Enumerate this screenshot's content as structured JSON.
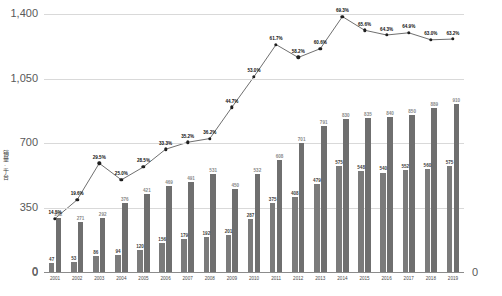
{
  "axes": {
    "y_left_title": "销量·千台",
    "y_left_ticks": [
      "1,400",
      "1,050",
      "700",
      "350",
      "0"
    ],
    "y_right_ticks": [
      "70%",
      "52.5%",
      "35%",
      "17.5%",
      "0"
    ]
  },
  "chart_data": {
    "type": "bar",
    "title": "",
    "subtitle": "",
    "xlabel": "",
    "ylabel": "销量·千台",
    "y2label": "",
    "ylim": [
      0,
      1400
    ],
    "y2lim": [
      0,
      70
    ],
    "yticks": [
      0,
      350,
      700,
      1050,
      1400
    ],
    "y2ticks": [
      0,
      17.5,
      35,
      52.5,
      70
    ],
    "grid": true,
    "legend": "none",
    "categories": [
      "2001",
      "2002",
      "2003",
      "2004",
      "2005",
      "2006",
      "2007",
      "2008",
      "2009",
      "2010",
      "2011",
      "2012",
      "2013",
      "2014",
      "2015",
      "2016",
      "2017",
      "2018",
      "2019"
    ],
    "series": [
      {
        "name": "series-front",
        "chart_type": "bar",
        "axis": "left",
        "values": [
          47,
          53,
          86,
          94,
          120,
          156,
          179,
          192,
          201,
          287,
          375,
          408,
          479,
          575,
          548,
          540,
          552,
          560,
          575
        ]
      },
      {
        "name": "series-back",
        "chart_type": "bar",
        "axis": "left",
        "values": [
          292,
          271,
          292,
          376,
          421,
          469,
          491,
          531,
          450,
          532,
          608,
          701,
          791,
          830,
          835,
          840,
          850,
          889,
          910
        ]
      },
      {
        "name": "series-rate",
        "chart_type": "line",
        "axis": "right",
        "values": [
          14.5,
          19.6,
          29.5,
          25.0,
          28.5,
          33.3,
          35.2,
          36.2,
          44.7,
          53.0,
          61.7,
          58.2,
          60.6,
          69.3,
          65.6,
          64.3,
          64.9,
          63.0,
          63.2
        ],
        "labels": [
          "14.5%",
          "19.6%",
          "29.5%",
          "25.0%",
          "28.5%",
          "33.3%",
          "35.2%",
          "36.2%",
          "44.7%",
          "53.0%",
          "61.7%",
          "58.2%",
          "60.6%",
          "69.3%",
          "65.6%",
          "64.3%",
          "64.9%",
          "63.0%",
          "63.2%"
        ]
      }
    ],
    "bar_labels_front": [
      "47",
      "53",
      "86",
      "94",
      "120",
      "156",
      "179",
      "192",
      "201",
      "287",
      "375",
      "408",
      "479",
      "575",
      "548",
      "540",
      "552",
      "560",
      "575"
    ],
    "bar_labels_back": [
      "292",
      "271",
      "292",
      "376",
      "421",
      "469",
      "491",
      "531",
      "450",
      "532",
      "608",
      "701",
      "791",
      "830",
      "835",
      "840",
      "850",
      "889",
      "910"
    ]
  }
}
